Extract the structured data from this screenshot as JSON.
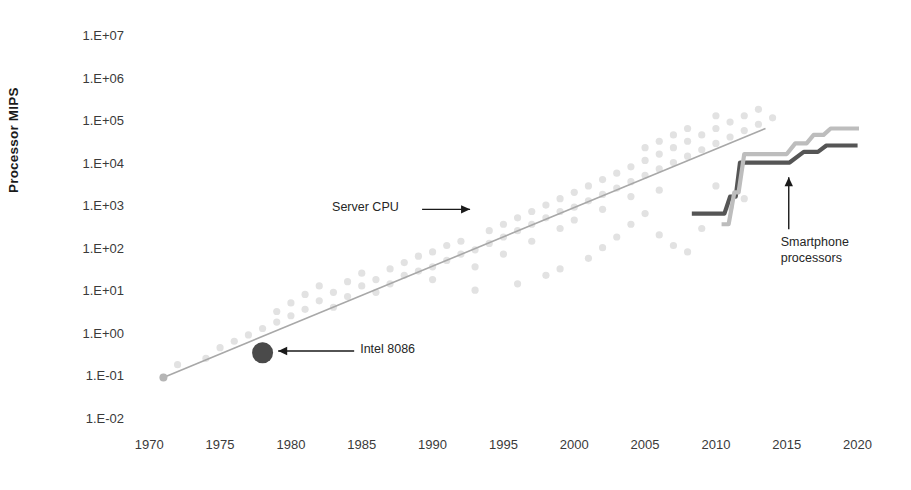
{
  "chart_data": {
    "type": "scatter",
    "title": "",
    "subtitle": "",
    "xlabel": "",
    "ylabel": "Processor MIPS",
    "xlim": [
      1968.5,
      2022.5
    ],
    "ylim": [
      -2,
      7
    ],
    "y_scale": "log10",
    "grid": false,
    "legend_position": "none",
    "x_ticks": [
      "1970",
      "1975",
      "1980",
      "1985",
      "1990",
      "1995",
      "2000",
      "2005",
      "2010",
      "2015",
      "2020"
    ],
    "x_tick_values": [
      1970,
      1975,
      1980,
      1985,
      1990,
      1995,
      2000,
      2005,
      2010,
      2015,
      2020
    ],
    "y_ticks": [
      "1.E+07",
      "1.E+06",
      "1.E+05",
      "1.E+04",
      "1.E+03",
      "1.E+02",
      "1.E+01",
      "1.E+00",
      "1.E-01",
      "1.E-02"
    ],
    "y_tick_exponents": [
      7,
      6,
      5,
      4,
      3,
      2,
      1,
      0,
      -1,
      -2
    ],
    "annotations": [
      {
        "name": "server-cpu",
        "text": "Server CPU",
        "arrow": "right",
        "x": 1987.0,
        "y_exp": 2.95
      },
      {
        "name": "intel-8086",
        "text": "Intel 8086",
        "arrow": "left",
        "x": 1981.5,
        "y_exp": -0.38
      },
      {
        "name": "smartphone-processors",
        "text": "Smartphone processors",
        "arrow": "up",
        "x": 2015.0,
        "y_exp": 2.25
      }
    ],
    "series": [
      {
        "name": "Server CPU scatter",
        "type": "scatter",
        "color": "#e2e2e2",
        "points": [
          [
            1971,
            -1.0
          ],
          [
            1972,
            -0.7
          ],
          [
            1974,
            -0.55
          ],
          [
            1975,
            -0.3
          ],
          [
            1976,
            -0.15
          ],
          [
            1977,
            0.0
          ],
          [
            1978,
            -0.25
          ],
          [
            1978,
            0.15
          ],
          [
            1979,
            0.3
          ],
          [
            1979,
            0.55
          ],
          [
            1980,
            0.45
          ],
          [
            1980,
            0.75
          ],
          [
            1981,
            0.6
          ],
          [
            1981,
            0.95
          ],
          [
            1982,
            0.8
          ],
          [
            1982,
            1.15
          ],
          [
            1983,
            1.0
          ],
          [
            1983,
            0.65
          ],
          [
            1984,
            1.25
          ],
          [
            1984,
            0.9
          ],
          [
            1985,
            1.15
          ],
          [
            1985,
            1.45
          ],
          [
            1986,
            1.3
          ],
          [
            1986,
            1.0
          ],
          [
            1987,
            1.55
          ],
          [
            1987,
            1.2
          ],
          [
            1988,
            1.4
          ],
          [
            1988,
            1.7
          ],
          [
            1989,
            1.5
          ],
          [
            1989,
            1.85
          ],
          [
            1990,
            1.6
          ],
          [
            1990,
            1.95
          ],
          [
            1990,
            1.3
          ],
          [
            1991,
            1.75
          ],
          [
            1991,
            2.1
          ],
          [
            1992,
            1.9
          ],
          [
            1992,
            2.2
          ],
          [
            1993,
            2.0
          ],
          [
            1993,
            1.6
          ],
          [
            1994,
            2.15
          ],
          [
            1994,
            2.45
          ],
          [
            1995,
            2.3
          ],
          [
            1995,
            2.6
          ],
          [
            1995,
            1.9
          ],
          [
            1996,
            2.45
          ],
          [
            1996,
            2.75
          ],
          [
            1997,
            2.6
          ],
          [
            1997,
            2.9
          ],
          [
            1997,
            2.2
          ],
          [
            1998,
            2.75
          ],
          [
            1998,
            3.05
          ],
          [
            1999,
            2.9
          ],
          [
            1999,
            3.2
          ],
          [
            1999,
            2.5
          ],
          [
            2000,
            3.0
          ],
          [
            2000,
            3.35
          ],
          [
            2000,
            2.7
          ],
          [
            2001,
            3.15
          ],
          [
            2001,
            3.5
          ],
          [
            2002,
            3.3
          ],
          [
            2002,
            3.65
          ],
          [
            2002,
            2.95
          ],
          [
            2003,
            3.45
          ],
          [
            2003,
            3.8
          ],
          [
            2004,
            3.6
          ],
          [
            2004,
            3.95
          ],
          [
            2004,
            3.25
          ],
          [
            2005,
            3.75
          ],
          [
            2005,
            4.1
          ],
          [
            2005,
            4.4
          ],
          [
            2006,
            3.9
          ],
          [
            2006,
            4.25
          ],
          [
            2006,
            4.55
          ],
          [
            2006,
            3.4
          ],
          [
            2007,
            4.05
          ],
          [
            2007,
            4.4
          ],
          [
            2007,
            4.7
          ],
          [
            2008,
            4.2
          ],
          [
            2008,
            4.55
          ],
          [
            2008,
            4.85
          ],
          [
            2009,
            4.35
          ],
          [
            2009,
            4.7
          ],
          [
            2010,
            4.5
          ],
          [
            2010,
            4.85
          ],
          [
            2010,
            5.15
          ],
          [
            2011,
            4.65
          ],
          [
            2011,
            5.0
          ],
          [
            2012,
            4.8
          ],
          [
            2012,
            5.15
          ],
          [
            2013,
            4.95
          ],
          [
            2013,
            5.3
          ],
          [
            2014,
            5.1
          ],
          [
            2004,
            2.6
          ],
          [
            2006,
            2.35
          ],
          [
            2007,
            2.1
          ],
          [
            2008,
            1.95
          ],
          [
            2003,
            2.3
          ],
          [
            2002,
            2.05
          ],
          [
            2001,
            1.8
          ],
          [
            2005,
            2.85
          ],
          [
            2009,
            2.5
          ],
          [
            1999,
            1.55
          ],
          [
            1998,
            1.4
          ],
          [
            1996,
            1.2
          ],
          [
            1993,
            1.05
          ],
          [
            2011,
            3.0
          ],
          [
            2010,
            3.5
          ],
          [
            2012,
            3.2
          ]
        ]
      },
      {
        "name": "Server CPU trend",
        "type": "line",
        "color": "#a8a8a8",
        "points": [
          [
            1971,
            -1.0
          ],
          [
            2013.5,
            4.85
          ]
        ]
      },
      {
        "name": "Smartphone processors (dark)",
        "type": "step",
        "color": "#555555",
        "points": [
          [
            2008.3,
            2.85
          ],
          [
            2010.6,
            2.85
          ],
          [
            2011.0,
            3.25
          ],
          [
            2011.4,
            3.25
          ],
          [
            2011.7,
            4.05
          ],
          [
            2014.6,
            4.05
          ],
          [
            2015.2,
            4.05
          ],
          [
            2016.2,
            4.3
          ],
          [
            2017.2,
            4.3
          ],
          [
            2017.8,
            4.45
          ],
          [
            2020.0,
            4.45
          ]
        ]
      },
      {
        "name": "Smartphone processors (light)",
        "type": "step",
        "color": "#bdbdbd",
        "points": [
          [
            2010.4,
            2.6
          ],
          [
            2010.9,
            2.6
          ],
          [
            2011.3,
            3.35
          ],
          [
            2011.6,
            3.35
          ],
          [
            2012.0,
            4.25
          ],
          [
            2015.0,
            4.25
          ],
          [
            2015.6,
            4.5
          ],
          [
            2016.4,
            4.5
          ],
          [
            2016.9,
            4.7
          ],
          [
            2017.6,
            4.7
          ],
          [
            2018.1,
            4.85
          ],
          [
            2020.1,
            4.85
          ]
        ]
      },
      {
        "name": "Intel 8086 marker",
        "type": "scatter",
        "color": "#4a4a4a",
        "points": [
          [
            1978.0,
            -0.42
          ]
        ]
      }
    ]
  }
}
